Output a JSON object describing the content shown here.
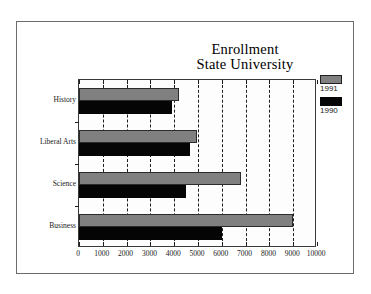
{
  "figure": {
    "frame_color": "#6b6b6b",
    "background": "#ffffff"
  },
  "title": {
    "line1": "Enrollment",
    "line2": "State University"
  },
  "legend": {
    "entries": [
      {
        "label": "1991",
        "color": "#808080",
        "swatch_name": "legend-swatch-1991"
      },
      {
        "label": "1990",
        "color": "#000000",
        "swatch_name": "legend-swatch-1990"
      }
    ]
  },
  "axis": {
    "x_ticks": [
      "0",
      "1000",
      "2000",
      "3000",
      "4000",
      "5000",
      "6000",
      "7000",
      "8000",
      "9000",
      "10000"
    ],
    "y_categories": [
      "History",
      "Liberal Arts",
      "Science",
      "Business"
    ]
  },
  "chart_data": {
    "type": "bar",
    "orientation": "horizontal",
    "title": "Enrollment State University",
    "xlabel": "",
    "ylabel": "",
    "xlim": [
      0,
      10000
    ],
    "xticks": [
      0,
      1000,
      2000,
      3000,
      4000,
      5000,
      6000,
      7000,
      8000,
      9000,
      10000
    ],
    "grid": true,
    "grid_axis": "x",
    "grid_style": "dashed",
    "legend_position": "right",
    "categories": [
      "History",
      "Liberal Arts",
      "Science",
      "Business"
    ],
    "series": [
      {
        "name": "1991",
        "color": "#808080",
        "values": [
          4200,
          4950,
          6800,
          9000
        ]
      },
      {
        "name": "1990",
        "color": "#000000",
        "values": [
          3900,
          4650,
          4500,
          6000
        ]
      }
    ]
  }
}
